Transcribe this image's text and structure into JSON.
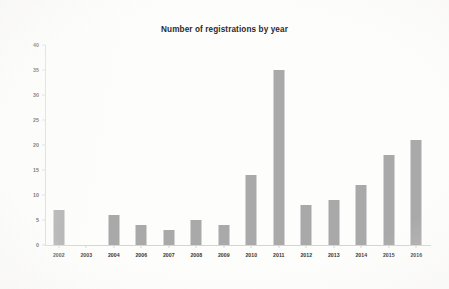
{
  "chart_data": {
    "type": "bar",
    "title": "Number of registrations by year",
    "xlabel": "",
    "ylabel": "",
    "categories": [
      "2002",
      "2003",
      "2004",
      "2006",
      "2007",
      "2008",
      "2009",
      "2010",
      "2011",
      "2012",
      "2013",
      "2014",
      "2015",
      "2016"
    ],
    "values": [
      7,
      0,
      6,
      4,
      3,
      5,
      4,
      14,
      35,
      8,
      9,
      12,
      18,
      21
    ],
    "ylim": [
      0,
      40
    ],
    "ytick_labels": [
      "40",
      "35",
      "30",
      "25",
      "20",
      "15",
      "10",
      "5",
      "0"
    ],
    "ytick_values": [
      40,
      35,
      30,
      25,
      20,
      15,
      10,
      5,
      0
    ],
    "grid": false,
    "legend": false,
    "bar_color": "#a9a9a9",
    "axis_color": "#d6d6d4",
    "background_color": "#fdfdfc"
  }
}
